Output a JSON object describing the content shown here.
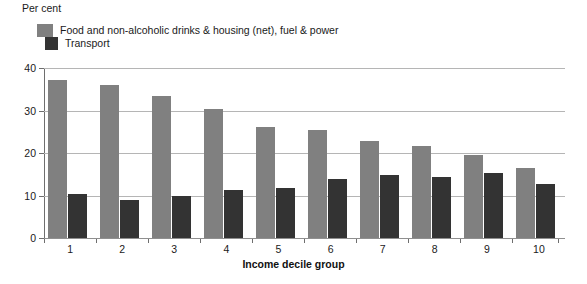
{
  "chart_data": {
    "type": "bar",
    "title": "",
    "unit_label": "Per cent",
    "xlabel": "Income decile group",
    "ylabel": "",
    "categories": [
      "1",
      "2",
      "3",
      "4",
      "5",
      "6",
      "7",
      "8",
      "9",
      "10"
    ],
    "ylim": [
      0,
      40
    ],
    "yticks": [
      0,
      10,
      20,
      30,
      40
    ],
    "grid": true,
    "legend_position": "top-left",
    "series": [
      {
        "name": "Food and non-alcoholic drinks & housing (net), fuel & power",
        "color": "#808080",
        "values": [
          37.2,
          36.0,
          33.5,
          30.3,
          26.2,
          25.3,
          22.9,
          21.6,
          19.5,
          16.5
        ]
      },
      {
        "name": "Transport",
        "color": "#333333",
        "values": [
          10.3,
          9.0,
          9.9,
          11.2,
          11.7,
          13.9,
          14.9,
          14.3,
          15.2,
          12.7
        ]
      }
    ]
  },
  "axis": {
    "y_tick_labels": [
      "40",
      "30",
      "20",
      "10",
      "0"
    ],
    "x_tick_labels": [
      "1",
      "2",
      "3",
      "4",
      "5",
      "6",
      "7",
      "8",
      "9",
      "10"
    ],
    "x_title": "Income decile group",
    "unit": "Per cent"
  },
  "legend": {
    "items": [
      {
        "label": "Food and non-alcoholic drinks & housing (net), fuel & power",
        "color": "#808080"
      },
      {
        "label": "Transport",
        "color": "#333333"
      }
    ]
  }
}
